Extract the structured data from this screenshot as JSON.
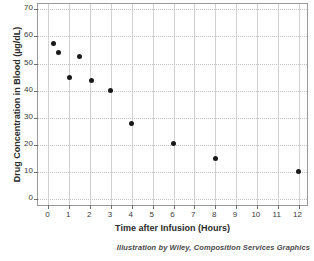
{
  "chart_data": {
    "type": "scatter",
    "title": "",
    "xlabel": "Time after Infusion (Hours)",
    "ylabel": "Drug Concentration in Blood (µg/dL)",
    "xlim": [
      -0.5,
      12.5
    ],
    "ylim": [
      -3,
      72
    ],
    "xticks": [
      0,
      1,
      2,
      3,
      4,
      5,
      6,
      7,
      8,
      9,
      10,
      11,
      12
    ],
    "xticklabels": [
      "0",
      "1",
      "2",
      "3",
      "4",
      "5",
      "6",
      "7",
      "8",
      "9",
      "10",
      "11",
      "12"
    ],
    "yticks": [
      0,
      10,
      20,
      30,
      40,
      50,
      60,
      70
    ],
    "yticklabels": [
      "0",
      "10",
      "20",
      "30",
      "40",
      "50",
      "60",
      "70"
    ],
    "grid": true,
    "legend": false,
    "marker": "filled-circle",
    "marker_color": "#1a1a1a",
    "grid_color": "#d2d2d2",
    "axes_border_color": "#9a9a9a",
    "points": [
      {
        "x": 0.25,
        "y": 57.5
      },
      {
        "x": 0.5,
        "y": 54.0
      },
      {
        "x": 1.0,
        "y": 45.0
      },
      {
        "x": 1.5,
        "y": 52.7
      },
      {
        "x": 2.05,
        "y": 43.6
      },
      {
        "x": 3.0,
        "y": 40.2
      },
      {
        "x": 4.0,
        "y": 28.0
      },
      {
        "x": 6.0,
        "y": 20.6
      },
      {
        "x": 8.0,
        "y": 15.0
      },
      {
        "x": 12.0,
        "y": 10.0
      }
    ],
    "x": [
      0.25,
      0.5,
      1.0,
      1.5,
      2.05,
      3.0,
      4.0,
      6.0,
      8.0,
      12.0
    ],
    "values": [
      57.5,
      54.0,
      45.0,
      52.7,
      43.6,
      40.2,
      28.0,
      20.6,
      15.0,
      10.0
    ]
  },
  "credit": {
    "text": "Illustration by Wiley, Composition Services Graphics"
  }
}
